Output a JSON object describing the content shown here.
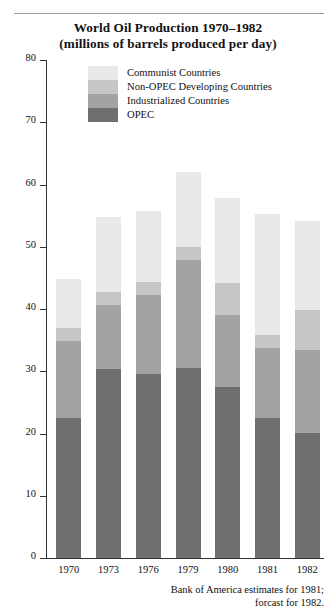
{
  "chart_data": {
    "type": "bar",
    "stacked": true,
    "title": "World Oil Production 1970–1982",
    "subtitle": "(millions of barrels produced per day)",
    "xlabel": "",
    "ylabel": "",
    "ylim": [
      0,
      80
    ],
    "yticks": [
      "0",
      "10",
      "20",
      "30",
      "40",
      "50",
      "60",
      "70",
      "80"
    ],
    "ytick_values": [
      0,
      10,
      20,
      30,
      40,
      50,
      60,
      70,
      80
    ],
    "grid": false,
    "legend_position": "inside-top-left",
    "categories": [
      "1970",
      "1973",
      "1976",
      "1979",
      "1980",
      "1981",
      "1982"
    ],
    "series": [
      {
        "name": "OPEC",
        "color": "#6f6f6f",
        "values": [
          22.5,
          30.3,
          29.5,
          30.5,
          27.5,
          22.5,
          20.1
        ]
      },
      {
        "name": "Industrialized Countries",
        "color": "#a3a3a3",
        "values": [
          12.4,
          10.4,
          12.8,
          17.3,
          11.6,
          11.3,
          13.3
        ]
      },
      {
        "name": "Non-OPEC Developing Countries",
        "color": "#c6c6c6",
        "values": [
          2.1,
          2.0,
          2.1,
          2.2,
          5.1,
          2.0,
          6.5
        ]
      },
      {
        "name": "Communist Countries",
        "color": "#e9e9e9",
        "values": [
          7.8,
          12.1,
          11.4,
          12.0,
          13.7,
          19.5,
          14.3
        ]
      }
    ],
    "totals": [
      44.8,
      54.8,
      55.8,
      62.0,
      57.9,
      55.3,
      54.2
    ],
    "annotations": [
      "Bank of America estimates for 1981;",
      "forcast for 1982."
    ]
  },
  "legend": {
    "items": [
      {
        "label": "Communist Countries",
        "color": "#e9e9e9"
      },
      {
        "label": "Non-OPEC Developing Countries",
        "color": "#c6c6c6"
      },
      {
        "label": "Industrialized Countries",
        "color": "#a3a3a3"
      },
      {
        "label": "OPEC",
        "color": "#6f6f6f"
      }
    ]
  },
  "footnote": {
    "line1": "Bank of America estimates for 1981;",
    "line2": "forcast for 1982."
  }
}
